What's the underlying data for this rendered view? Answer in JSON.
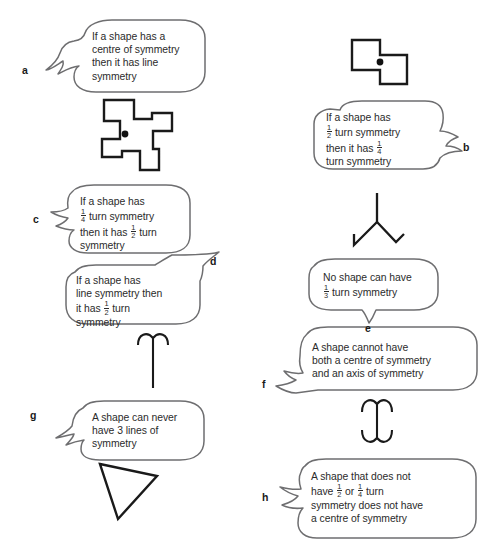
{
  "page": {
    "background_color": "#ffffff",
    "ink_color": "#231f20",
    "bubble_outline_color": "#6e6e70"
  },
  "bubbles": [
    {
      "id": "a",
      "label": "a",
      "lines": [
        "If a shape has a",
        "centre of symmetry",
        "then it has line",
        "symmetry"
      ],
      "plain_text": "If a shape has a centre of symmetry then it has line symmetry",
      "tail_side": "left"
    },
    {
      "id": "b",
      "label": "b",
      "lines": [
        "If a shape has",
        "1/2 turn symmetry",
        "then it has 1/4",
        "turn symmetry"
      ],
      "plain_text": "If a shape has 1/2 turn symmetry then it has 1/4 turn symmetry",
      "tail_side": "right"
    },
    {
      "id": "c",
      "label": "c",
      "lines": [
        "If a shape has",
        "1/4 turn symmetry",
        "then it has 1/2 turn",
        "symmetry"
      ],
      "plain_text": "If a shape has 1/4 turn symmetry then it has 1/2 turn symmetry",
      "tail_side": "left"
    },
    {
      "id": "d",
      "label": "d",
      "lines": [
        "If a shape has",
        "line symmetry then",
        "it has 1/2 turn",
        "symmetry"
      ],
      "plain_text": "If a shape has line symmetry then it has 1/2 turn symmetry",
      "tail_side": "top-right"
    },
    {
      "id": "e",
      "label": "e",
      "lines": [
        "No shape can have",
        "1/3 turn symmetry"
      ],
      "plain_text": "No shape can have 1/3 turn symmetry",
      "tail_side": "bottom"
    },
    {
      "id": "f",
      "label": "f",
      "lines": [
        "A shape cannot have",
        "both a centre of symmetry",
        "and an axis of symmetry"
      ],
      "plain_text": "A shape cannot have both a centre of symmetry and an axis of symmetry",
      "tail_side": "left"
    },
    {
      "id": "g",
      "label": "g",
      "lines": [
        "A shape can never",
        "have 3 lines of",
        "symmetry"
      ],
      "plain_text": "A shape can never have 3 lines of symmetry",
      "tail_side": "left"
    },
    {
      "id": "h",
      "label": "h",
      "lines": [
        "A shape that does not",
        "have 1/2 or 1/4 turn",
        "symmetry does not have",
        "a centre of symmetry"
      ],
      "plain_text": "A shape that does not have 1/2 or 1/4 turn symmetry does not have a centre of symmetry",
      "tail_side": "left"
    }
  ],
  "figures": [
    {
      "id": "pinwheel-cross",
      "description": "pinwheel cross polygon with centre dot",
      "has_centre_dot": true
    },
    {
      "id": "z-hexomino",
      "description": "Z-shaped hexomino with centre dot",
      "has_centre_dot": true
    },
    {
      "id": "y-shape",
      "description": "three-branch Y shape with hooked ends",
      "has_centre_dot": false
    },
    {
      "id": "t-shape",
      "description": "inverted-Y / T shape with curved arms",
      "has_centre_dot": false
    },
    {
      "id": "i-beam-shape",
      "description": "I-beam shape with curved serifs top and bottom",
      "has_centre_dot": false
    },
    {
      "id": "scalene-triangle",
      "description": "scalene triangle outline",
      "has_centre_dot": false
    }
  ]
}
